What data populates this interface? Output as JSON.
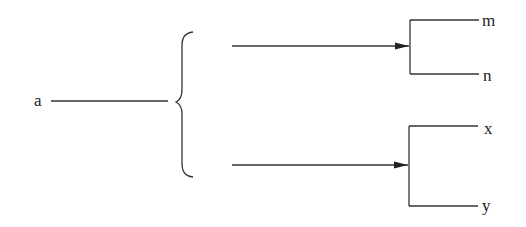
{
  "diagram": {
    "type": "tree-bracket",
    "root": {
      "label": "a"
    },
    "groups": [
      {
        "id": "top",
        "children": [
          {
            "label": "m"
          },
          {
            "label": "n"
          }
        ]
      },
      {
        "id": "bottom",
        "children": [
          {
            "label": "x"
          },
          {
            "label": "y"
          }
        ]
      }
    ],
    "colors": {
      "line": "#333333",
      "text": "#222222",
      "background": "#ffffff"
    }
  }
}
